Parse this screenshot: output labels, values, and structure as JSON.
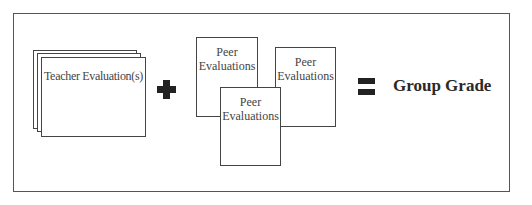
{
  "diagram": {
    "teacher": {
      "label": "Teacher Evaluation(s)",
      "stack_count": 3
    },
    "operator_plus": {
      "symbol": "+"
    },
    "peers": [
      {
        "label_line1": "Peer",
        "label_line2": "Evaluations"
      },
      {
        "label_line1": "Peer",
        "label_line2": "Evaluations"
      },
      {
        "label_line1": "Peer",
        "label_line2": "Evaluations"
      }
    ],
    "operator_equals": {
      "symbol": "="
    },
    "result": {
      "label": "Group Grade"
    }
  }
}
